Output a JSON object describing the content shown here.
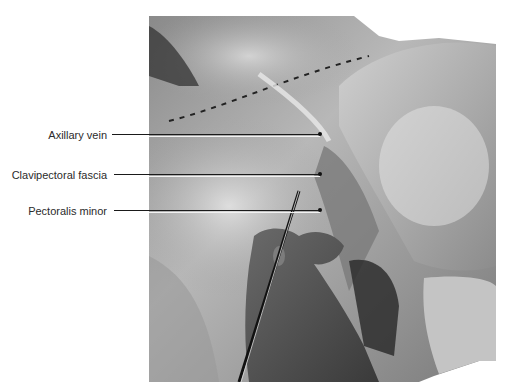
{
  "figure": {
    "type": "anatomical-dissection-photo",
    "colorMode": "grayscale",
    "background": "#ffffff",
    "labelColor": "#2b2b2b",
    "leaderLineColor": "#1a1a1a",
    "labels": [
      {
        "text": "Axillary vein",
        "y": 135
      },
      {
        "text": "Clavipectoral fascia",
        "y": 175
      },
      {
        "text": "Pectoralis minor",
        "y": 211
      }
    ]
  }
}
